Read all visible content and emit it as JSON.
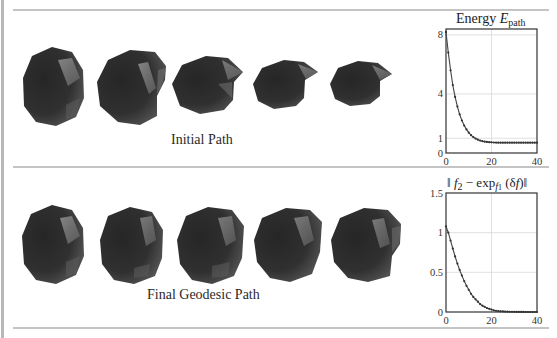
{
  "panels": [
    {
      "caption": "Initial Path",
      "shape_count": 5
    },
    {
      "caption": "Final Geodesic Path",
      "shape_count": 5
    }
  ],
  "plot1": {
    "title_prefix": "Energy ",
    "title_var": "E",
    "title_sub": "path"
  },
  "plot2": {
    "title_parts": [
      "‖ ",
      "f",
      "2",
      " − exp",
      "f",
      "1",
      " (δ",
      "f",
      ")‖"
    ]
  },
  "chart_data": [
    {
      "type": "line",
      "title": "Energy E_path",
      "xlabel": "",
      "ylabel": "",
      "x_ticks": [
        0,
        20,
        40
      ],
      "y_ticks": [
        0,
        1,
        4,
        8
      ],
      "xlim": [
        0,
        40
      ],
      "ylim": [
        0,
        8.4
      ],
      "grid": true,
      "marker": "dot",
      "x": [
        0,
        1,
        2,
        3,
        4,
        5,
        6,
        7,
        8,
        9,
        10,
        11,
        12,
        13,
        14,
        15,
        16,
        17,
        18,
        19,
        20,
        21,
        22,
        23,
        24,
        25,
        26,
        27,
        28,
        29,
        30,
        31,
        32,
        33,
        34,
        35,
        36,
        37,
        38,
        39,
        40
      ],
      "values": [
        8.2,
        6.8,
        5.6,
        4.6,
        3.8,
        3.15,
        2.62,
        2.2,
        1.86,
        1.6,
        1.38,
        1.21,
        1.08,
        0.98,
        0.9,
        0.84,
        0.8,
        0.77,
        0.75,
        0.73,
        0.72,
        0.71,
        0.705,
        0.7,
        0.7,
        0.7,
        0.7,
        0.7,
        0.7,
        0.7,
        0.7,
        0.7,
        0.7,
        0.7,
        0.7,
        0.7,
        0.7,
        0.7,
        0.7,
        0.7,
        0.7
      ]
    },
    {
      "type": "line",
      "title": "|| f_2 - exp_{f_1}(δf) ||",
      "xlabel": "",
      "ylabel": "",
      "x_ticks": [
        0,
        20,
        40
      ],
      "y_ticks": [
        0,
        0.5,
        1,
        1.5
      ],
      "xlim": [
        0,
        40
      ],
      "ylim": [
        0,
        1.5
      ],
      "grid": true,
      "marker": "dot",
      "x": [
        0,
        1,
        2,
        3,
        4,
        5,
        6,
        7,
        8,
        9,
        10,
        11,
        12,
        13,
        14,
        15,
        16,
        17,
        18,
        19,
        20,
        21,
        22,
        23,
        24,
        25,
        26,
        27,
        28,
        29,
        30,
        31,
        32,
        33,
        34,
        35,
        36,
        37,
        38,
        39,
        40
      ],
      "values": [
        1.08,
        1.0,
        0.9,
        0.8,
        0.7,
        0.61,
        0.53,
        0.46,
        0.39,
        0.33,
        0.28,
        0.23,
        0.19,
        0.16,
        0.13,
        0.1,
        0.08,
        0.065,
        0.05,
        0.04,
        0.03,
        0.022,
        0.016,
        0.012,
        0.009,
        0.007,
        0.005,
        0.004,
        0.003,
        0.002,
        0.002,
        0.001,
        0.001,
        0.001,
        0.001,
        0.0,
        0.0,
        0.0,
        0.0,
        0.0,
        0.0
      ]
    }
  ]
}
